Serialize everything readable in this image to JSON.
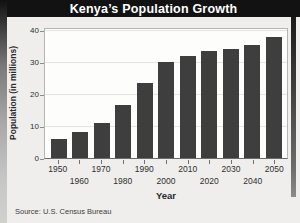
{
  "title": "Kenya’s Population Growth",
  "source_note": "Source: U.S. Census Bureau",
  "colors": {
    "banner_bg": "#121212",
    "banner_text": "#ffffff",
    "bar": "#3e3e3e",
    "plot_bg": "#fdfdfc",
    "page_bg": "#efeeec"
  },
  "chart_data": {
    "type": "bar",
    "title": "Kenya’s Population Growth",
    "xlabel": "Year",
    "ylabel": "Population (in millions)",
    "categories": [
      "1950",
      "1960",
      "1970",
      "1980",
      "1990",
      "2000",
      "2010",
      "2020",
      "2030",
      "2040",
      "2050"
    ],
    "values": [
      6,
      8,
      11,
      16.5,
      23.5,
      30,
      32,
      33.5,
      34,
      35.5,
      38
    ],
    "ylim": [
      0,
      40
    ],
    "yticks": [
      0,
      10,
      20,
      30,
      40
    ],
    "grid": true,
    "legend": false,
    "bar_color": "#3e3e3e"
  }
}
